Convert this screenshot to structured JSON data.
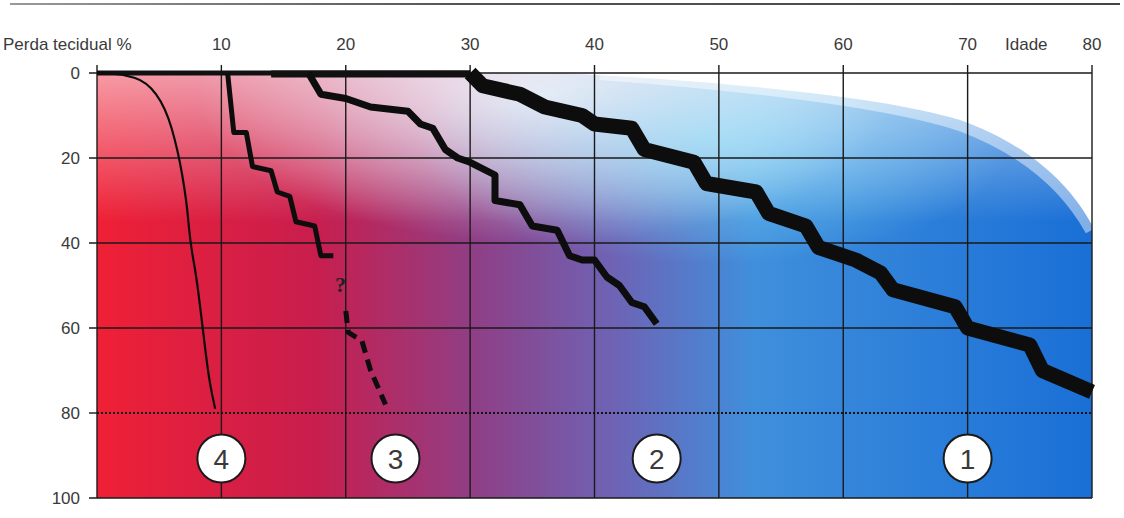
{
  "chart_data": {
    "type": "line",
    "title": "",
    "xlabel": "Idade",
    "ylabel": "Perda tecidual %",
    "x_ticks": [
      10,
      20,
      30,
      40,
      50,
      60,
      70,
      80
    ],
    "y_ticks": [
      0,
      20,
      40,
      60,
      80,
      100
    ],
    "xlim": [
      0,
      80
    ],
    "ylim": [
      0,
      100
    ],
    "y_inverted": true,
    "grid": true,
    "threshold_line": {
      "y": 80,
      "style": "dotted"
    },
    "background": "color gradient: red (left) -> violet -> blue (right), white region top-right",
    "series": [
      {
        "name": "1",
        "style": "very thick stepped band",
        "points": [
          [
            30,
            0
          ],
          [
            31,
            3
          ],
          [
            34,
            5
          ],
          [
            36,
            8
          ],
          [
            39,
            10
          ],
          [
            40,
            12
          ],
          [
            43,
            13
          ],
          [
            44,
            18
          ],
          [
            48,
            21
          ],
          [
            49,
            26
          ],
          [
            53,
            28
          ],
          [
            54,
            33
          ],
          [
            57,
            36
          ],
          [
            58,
            41
          ],
          [
            61,
            44
          ],
          [
            63,
            47
          ],
          [
            64,
            51
          ],
          [
            69,
            55
          ],
          [
            70,
            60
          ],
          [
            75,
            64
          ],
          [
            76,
            70
          ],
          [
            80,
            75
          ]
        ]
      },
      {
        "name": "2",
        "style": "thick stepped line",
        "points": [
          [
            17,
            0
          ],
          [
            18,
            5
          ],
          [
            20,
            6
          ],
          [
            22,
            8
          ],
          [
            25,
            9
          ],
          [
            26,
            12
          ],
          [
            27,
            13
          ],
          [
            28,
            18
          ],
          [
            29,
            20
          ],
          [
            30,
            21
          ],
          [
            32,
            24
          ],
          [
            32,
            30
          ],
          [
            34,
            31
          ],
          [
            35,
            36
          ],
          [
            37,
            37
          ],
          [
            38,
            43
          ],
          [
            39,
            44
          ],
          [
            40,
            44
          ],
          [
            41,
            48
          ],
          [
            42,
            50
          ],
          [
            43,
            54
          ],
          [
            44,
            55
          ],
          [
            45,
            59
          ]
        ]
      },
      {
        "name": "3",
        "style": "stepped line, dashed beyond '?'",
        "points": [
          [
            10.5,
            0
          ],
          [
            11,
            14
          ],
          [
            12,
            14
          ],
          [
            12.5,
            22
          ],
          [
            14,
            23
          ],
          [
            14.5,
            28
          ],
          [
            15.5,
            29
          ],
          [
            16,
            35
          ],
          [
            17.5,
            36
          ],
          [
            18,
            43
          ],
          [
            19,
            43
          ]
        ],
        "uncertain_label": "?",
        "dashed_points": [
          [
            20,
            56
          ],
          [
            20.2,
            61
          ],
          [
            21.3,
            63
          ],
          [
            22,
            70
          ],
          [
            23.2,
            78
          ]
        ]
      },
      {
        "name": "4",
        "style": "thin smooth curve",
        "points": [
          [
            0,
            0
          ],
          [
            2,
            0.2
          ],
          [
            4,
            2
          ],
          [
            5.5,
            8
          ],
          [
            6.5,
            18
          ],
          [
            7.2,
            30
          ],
          [
            7.5,
            40
          ],
          [
            8,
            48
          ],
          [
            8.5,
            60
          ],
          [
            9,
            72
          ],
          [
            9.5,
            79
          ]
        ]
      }
    ],
    "annotations": [
      {
        "text": "4",
        "x": 10,
        "y": 90,
        "shape": "circle"
      },
      {
        "text": "3",
        "x": 24,
        "y": 90,
        "shape": "circle"
      },
      {
        "text": "2",
        "x": 45,
        "y": 90,
        "shape": "circle"
      },
      {
        "text": "1",
        "x": 70,
        "y": 90,
        "shape": "circle"
      }
    ]
  },
  "labels": {
    "y_axis_title": "Perda tecidual %",
    "x_axis_title": "Idade",
    "question_mark": "?",
    "x_ticks": [
      "10",
      "20",
      "30",
      "40",
      "50",
      "60",
      "70",
      "80"
    ],
    "y_ticks": [
      "0",
      "20",
      "40",
      "60",
      "80",
      "100"
    ],
    "badges": [
      "4",
      "3",
      "2",
      "1"
    ]
  }
}
